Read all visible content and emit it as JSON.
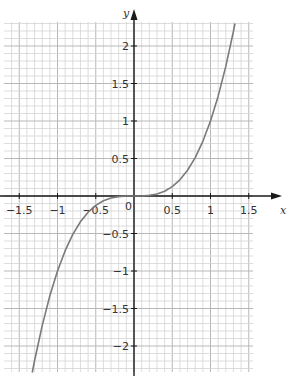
{
  "chart_data": {
    "type": "line",
    "title": "",
    "xlabel": "x",
    "ylabel": "y",
    "function": "y = x^3",
    "xlim": [
      -1.6,
      1.65
    ],
    "ylim": [
      -2.35,
      2.32
    ],
    "grid": true,
    "grid_minor_step": 0.1,
    "grid_major_step": 0.5,
    "x_ticks": [
      {
        "value": -1.5,
        "label": "−1.5"
      },
      {
        "value": -1,
        "label": "−1"
      },
      {
        "value": -0.5,
        "label": "−0.5"
      },
      {
        "value": 0.5,
        "label": "0.5"
      },
      {
        "value": 1,
        "label": "1"
      },
      {
        "value": 1.5,
        "label": "1.5"
      }
    ],
    "y_ticks": [
      {
        "value": 2,
        "label": "2"
      },
      {
        "value": 1.5,
        "label": "1.5"
      },
      {
        "value": 1,
        "label": "1"
      },
      {
        "value": 0.5,
        "label": "0.5"
      },
      {
        "value": -0.5,
        "label": "−0.5"
      },
      {
        "value": -1,
        "label": "−1"
      },
      {
        "value": -1.5,
        "label": "−1.5"
      },
      {
        "value": -2,
        "label": "−2"
      }
    ],
    "origin_label": "0",
    "series": [
      {
        "name": "y = x^3",
        "x": [
          -1.33,
          -1.3,
          -1.2,
          -1.1,
          -1.0,
          -0.9,
          -0.8,
          -0.7,
          -0.6,
          -0.5,
          -0.4,
          -0.3,
          -0.2,
          -0.1,
          0,
          0.1,
          0.2,
          0.3,
          0.4,
          0.5,
          0.6,
          0.7,
          0.8,
          0.9,
          1.0,
          1.1,
          1.2,
          1.3,
          1.32
        ],
        "y": [
          -2.353,
          -2.197,
          -1.728,
          -1.331,
          -1.0,
          -0.729,
          -0.512,
          -0.343,
          -0.216,
          -0.125,
          -0.064,
          -0.027,
          -0.008,
          -0.001,
          0,
          0.001,
          0.008,
          0.027,
          0.064,
          0.125,
          0.216,
          0.343,
          0.512,
          0.729,
          1.0,
          1.331,
          1.728,
          2.197,
          2.3
        ]
      }
    ],
    "colors": {
      "grid_minor": "#d4d4d4",
      "grid_major": "#b8b8b8",
      "axis": "#1a1a1a",
      "curve": "#7a7a7a"
    }
  }
}
